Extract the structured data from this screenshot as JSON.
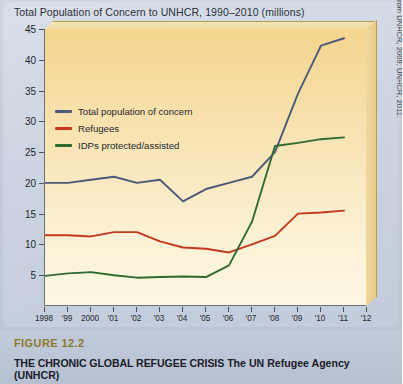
{
  "chart_title": "Total Population of Concern to UNHCR, 1990–2010 (millions)",
  "source_note": "Source: Based on data from UNHCR, 2009; UNHCR, 2011.",
  "caption": {
    "figure_number": "FIGURE 12.2",
    "headline": "THE CHRONIC GLOBAL REFUGEE CRISIS",
    "subhead": "The UN Refugee Agency (UNHCR)"
  },
  "colors": {
    "total": "#4a5a78",
    "refugees": "#c4391c",
    "idps": "#2f6b2f",
    "plot_fill": "#f8e3b2",
    "axis": "#6b6f78",
    "figure_number": "#8a7a2e"
  },
  "chart_data": {
    "type": "line",
    "title": "Total Population of Concern to UNHCR, 1990–2010 (millions)",
    "xlabel": "",
    "ylabel": "millions",
    "ylim": [
      0,
      45
    ],
    "yticks": [
      5,
      10,
      15,
      20,
      25,
      30,
      35,
      40,
      45
    ],
    "ytick_labels": [
      "5",
      "10",
      "15",
      "20",
      "25",
      "30",
      "35",
      "40",
      "45"
    ],
    "x": [
      1998,
      1999,
      2000,
      2001,
      2002,
      2003,
      2004,
      2005,
      2006,
      2007,
      2008,
      2009,
      2010,
      2011,
      2012
    ],
    "xtick_labels": [
      "1998",
      "'99",
      "2000",
      "'01",
      "'02",
      "'03",
      "'04",
      "'05",
      "'06",
      "'07",
      "'08",
      "'09",
      "'10",
      "'11",
      "'12"
    ],
    "grid": false,
    "legend_position": "upper-left",
    "series": [
      {
        "name": "Total population of concern",
        "color": "#4a5a78",
        "values": [
          20.0,
          20.0,
          20.5,
          21.0,
          20.0,
          20.5,
          17.0,
          19.0,
          20.0,
          21.0,
          25.0,
          34.5,
          42.3,
          43.5,
          null
        ]
      },
      {
        "name": "Refugees",
        "color": "#c4391c",
        "values": [
          11.5,
          11.5,
          11.3,
          12.0,
          12.0,
          10.5,
          9.5,
          9.3,
          8.7,
          10.0,
          11.4,
          15.0,
          15.2,
          15.5,
          null
        ]
      },
      {
        "name": "IDPs protected/assisted",
        "color": "#2f6b2f",
        "values": [
          4.9,
          5.3,
          5.5,
          5.0,
          4.6,
          4.7,
          4.8,
          4.7,
          6.6,
          13.7,
          26.0,
          26.5,
          27.1,
          27.4,
          null
        ]
      }
    ]
  },
  "legend": [
    {
      "label": "Total population of concern",
      "color": "#4a5a78"
    },
    {
      "label": "Refugees",
      "color": "#c4391c"
    },
    {
      "label": "IDPs protected/assisted",
      "color": "#2f6b2f"
    }
  ]
}
